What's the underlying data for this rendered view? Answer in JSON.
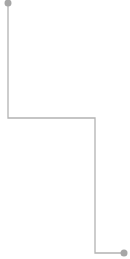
{
  "canvas": {
    "width": 130,
    "height": 259,
    "background": "#ffffff"
  },
  "connector": {
    "type": "elbow",
    "stroke_color": "#b3b3b3",
    "stroke_width": 1.3,
    "points": [
      [
        8,
        3
      ],
      [
        8,
        118
      ],
      [
        95,
        118
      ],
      [
        95,
        253
      ],
      [
        124,
        253
      ]
    ],
    "start_marker": {
      "shape": "circle",
      "cx": 8,
      "cy": 3,
      "r": 3.5,
      "fill": "#a6a6a6"
    },
    "end_marker": {
      "shape": "circle",
      "cx": 124,
      "cy": 253,
      "r": 3.5,
      "fill": "#a6a6a6"
    }
  }
}
